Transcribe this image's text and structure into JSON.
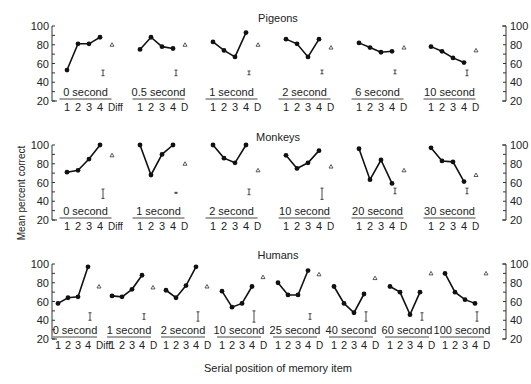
{
  "chart_data": {
    "type": "line",
    "xlabel": "Serial position of memory item",
    "ylabel": "Mean percent correct",
    "y_ticks": [
      20,
      40,
      60,
      80,
      100
    ],
    "ylim": [
      20,
      100
    ],
    "x_ticks_first": [
      "1",
      "2",
      "3",
      "4",
      "Diff"
    ],
    "x_ticks_other": [
      "1",
      "2",
      "3",
      "4",
      "D"
    ],
    "legend": "Dots/lines = accuracy at serial positions 1-4; triangle = different-trial accuracy (D); I-bar = error bar",
    "panels": [
      {
        "title": "Pigeons",
        "subplots": [
          {
            "label": "0 second",
            "values": [
              53,
              81,
              81,
              88
            ],
            "diff": 80,
            "err_center": 50,
            "err_half": 3
          },
          {
            "label": "0.5 second",
            "values": [
              75,
              88,
              78,
              76
            ],
            "diff": 80,
            "err_center": 50,
            "err_half": 3
          },
          {
            "label": "1 second",
            "values": [
              83,
              74,
              67,
              93
            ],
            "diff": 80,
            "err_center": 50,
            "err_half": 2
          },
          {
            "label": "2 second",
            "values": [
              86,
              81,
              67,
              86
            ],
            "diff": 77,
            "err_center": 51,
            "err_half": 2
          },
          {
            "label": "6 second",
            "values": [
              82,
              77,
              72,
              73
            ],
            "diff": 77,
            "err_center": 51,
            "err_half": 2
          },
          {
            "label": "10 second",
            "values": [
              78,
              73,
              66,
              61
            ],
            "diff": 74,
            "err_center": 50,
            "err_half": 3
          }
        ]
      },
      {
        "title": "Monkeys",
        "subplots": [
          {
            "label": "0 second",
            "values": [
              71,
              73,
              85,
              100
            ],
            "diff": 89,
            "err_center": 48,
            "err_half": 5
          },
          {
            "label": "1 second",
            "values": [
              100,
              68,
              90,
              100
            ],
            "diff": 80,
            "err_center": 49,
            "err_half": 0.5
          },
          {
            "label": "2 second",
            "values": [
              100,
              86,
              81,
              100
            ],
            "diff": 73,
            "err_center": 50,
            "err_half": 3
          },
          {
            "label": "10 second",
            "values": [
              89,
              75,
              81,
              94
            ],
            "diff": 77,
            "err_center": 48,
            "err_half": 6
          },
          {
            "label": "20 second",
            "values": [
              96,
              63,
              84,
              59
            ],
            "diff": 73,
            "err_center": 51,
            "err_half": 3
          },
          {
            "label": "30 second",
            "values": [
              97,
              83,
              82,
              61
            ],
            "diff": 68,
            "err_center": 51,
            "err_half": 3
          }
        ]
      },
      {
        "title": "Humans",
        "subplots": [
          {
            "label": "0 second",
            "values": [
              58,
              64,
              65,
              97
            ],
            "diff": 76,
            "err_center": 44,
            "err_half": 4
          },
          {
            "label": "1 second",
            "values": [
              66,
              65,
              73,
              88
            ],
            "diff": 75,
            "err_center": 44,
            "err_half": 3
          },
          {
            "label": "2 second",
            "values": [
              72,
              64,
              77,
              97
            ],
            "diff": 76,
            "err_center": 44,
            "err_half": 5
          },
          {
            "label": "10 second",
            "values": [
              71,
              54,
              58,
              76
            ],
            "diff": 86,
            "err_center": 44,
            "err_half": 6
          },
          {
            "label": "25 second",
            "values": [
              80,
              67,
              67,
              93
            ],
            "diff": 89,
            "err_center": 44,
            "err_half": 3
          },
          {
            "label": "40 second",
            "values": [
              76,
              58,
              48,
              68
            ],
            "diff": 85,
            "err_center": 44,
            "err_half": 5
          },
          {
            "label": "60 second",
            "values": [
              76,
              70,
              46,
              70
            ],
            "diff": 90,
            "err_center": 44,
            "err_half": 4
          },
          {
            "label": "100 second",
            "values": [
              90,
              70,
              62,
              58
            ],
            "diff": 90,
            "err_center": 44,
            "err_half": 5
          }
        ]
      }
    ]
  },
  "figure": {
    "xlabel": "Serial position of memory item",
    "ylabel": "Mean percent correct",
    "panel_titles": [
      "Pigeons",
      "Monkeys",
      "Humans"
    ]
  }
}
